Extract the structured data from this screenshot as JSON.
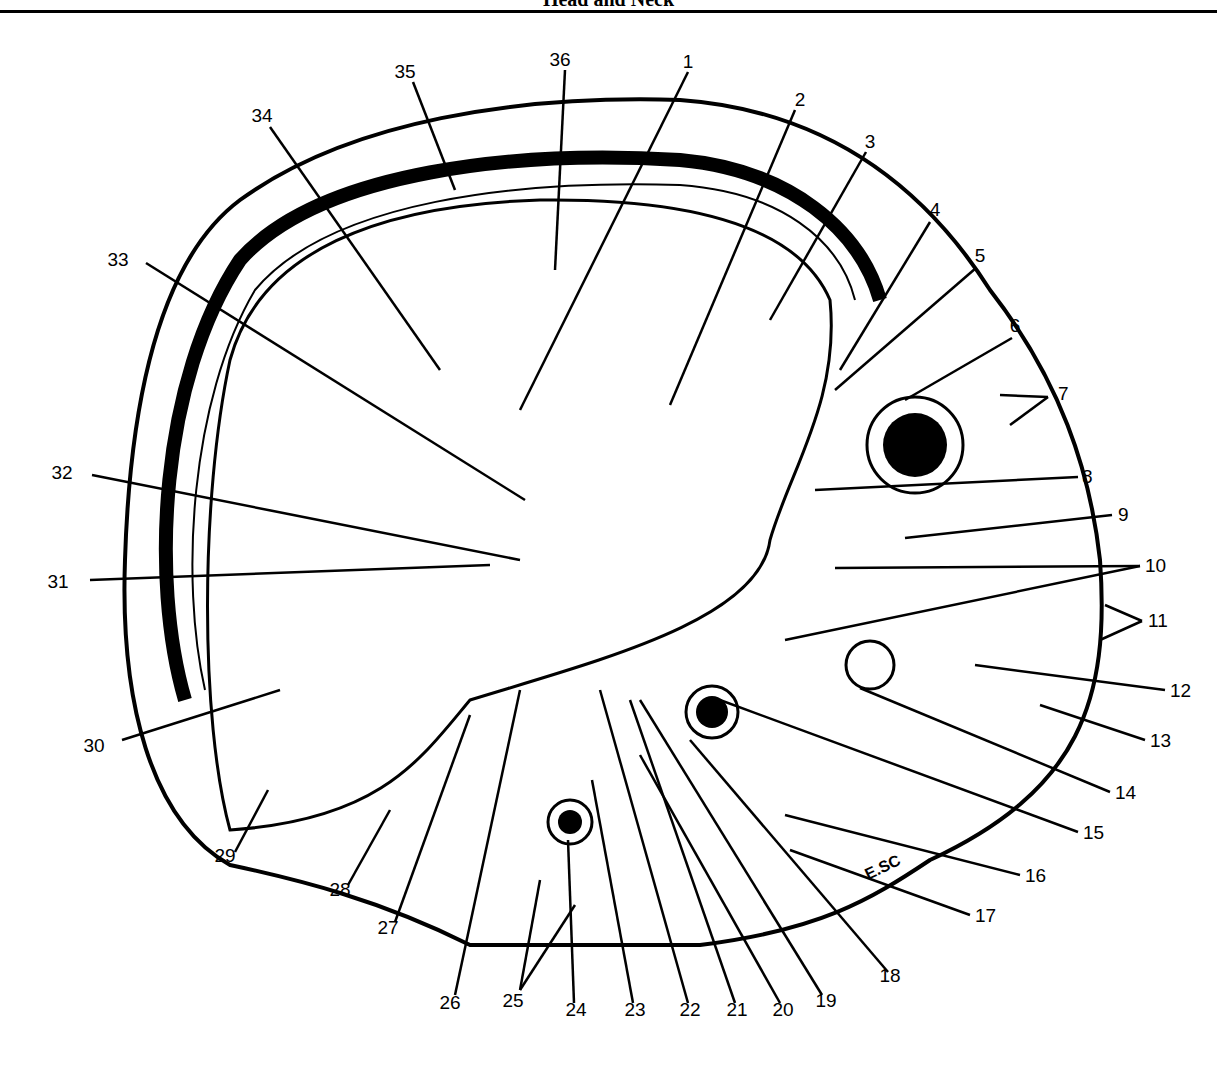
{
  "header": {
    "title": "Head and Neck"
  },
  "figure": {
    "signature": "E.SC",
    "labels": [
      {
        "n": "1",
        "x": 688,
        "y": 68
      },
      {
        "n": "2",
        "x": 800,
        "y": 106
      },
      {
        "n": "3",
        "x": 870,
        "y": 148
      },
      {
        "n": "4",
        "x": 935,
        "y": 216
      },
      {
        "n": "5",
        "x": 980,
        "y": 262
      },
      {
        "n": "6",
        "x": 1015,
        "y": 332
      },
      {
        "n": "7",
        "x": 1058,
        "y": 393
      },
      {
        "n": "8",
        "x": 1082,
        "y": 476
      },
      {
        "n": "9",
        "x": 1118,
        "y": 514
      },
      {
        "n": "10",
        "x": 1145,
        "y": 565
      },
      {
        "n": "11",
        "x": 1148,
        "y": 620
      },
      {
        "n": "12",
        "x": 1170,
        "y": 693
      },
      {
        "n": "13",
        "x": 1150,
        "y": 743
      },
      {
        "n": "14",
        "x": 1115,
        "y": 795
      },
      {
        "n": "15",
        "x": 1083,
        "y": 835
      },
      {
        "n": "16",
        "x": 1025,
        "y": 878
      },
      {
        "n": "17",
        "x": 975,
        "y": 918
      },
      {
        "n": "18",
        "x": 890,
        "y": 978
      },
      {
        "n": "19",
        "x": 826,
        "y": 1003
      },
      {
        "n": "20",
        "x": 783,
        "y": 1012
      },
      {
        "n": "21",
        "x": 737,
        "y": 1012
      },
      {
        "n": "22",
        "x": 690,
        "y": 1012
      },
      {
        "n": "23",
        "x": 635,
        "y": 1012
      },
      {
        "n": "24",
        "x": 576,
        "y": 1012
      },
      {
        "n": "25",
        "x": 513,
        "y": 1003
      },
      {
        "n": "26",
        "x": 450,
        "y": 1005
      },
      {
        "n": "27",
        "x": 388,
        "y": 930
      },
      {
        "n": "28",
        "x": 340,
        "y": 892
      },
      {
        "n": "29",
        "x": 225,
        "y": 858
      },
      {
        "n": "30",
        "x": 94,
        "y": 745
      },
      {
        "n": "31",
        "x": 58,
        "y": 584
      },
      {
        "n": "32",
        "x": 62,
        "y": 475
      },
      {
        "n": "33",
        "x": 118,
        "y": 262
      },
      {
        "n": "34",
        "x": 262,
        "y": 122
      },
      {
        "n": "35",
        "x": 405,
        "y": 78
      },
      {
        "n": "36",
        "x": 560,
        "y": 66
      }
    ]
  }
}
